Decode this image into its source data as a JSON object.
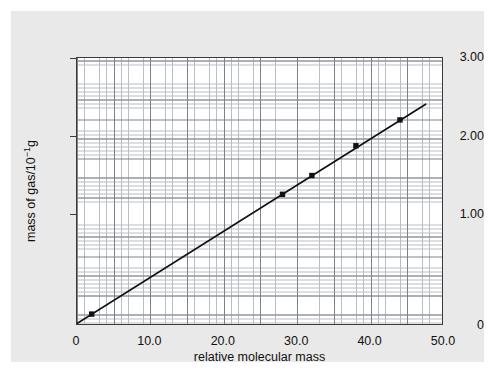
{
  "chart_data": {
    "type": "scatter",
    "title": "",
    "xlabel": "relative molecular mass",
    "ylabel": "mass of gas/10",
    "ylabel_exponent": "−1",
    "ylabel_unit": "g",
    "xlim": [
      0,
      50
    ],
    "ylim": [
      0,
      3.45
    ],
    "xticks": [
      "0",
      "10.0",
      "20.0",
      "30.0",
      "40.0",
      "50.0"
    ],
    "xtick_values": [
      0,
      10,
      20,
      30,
      40,
      50
    ],
    "yticks": [
      "0",
      "1.00",
      "2.00",
      "3.00"
    ],
    "ytick_values": [
      0,
      1.0,
      2.0,
      3.0
    ],
    "grid": true,
    "grid_style": "graph-paper",
    "legend": "none",
    "points": [
      {
        "x": 2,
        "y": 0.12
      },
      {
        "x": 28,
        "y": 1.65
      },
      {
        "x": 32,
        "y": 1.89
      },
      {
        "x": 38,
        "y": 2.27
      },
      {
        "x": 44,
        "y": 2.6
      }
    ],
    "series": [
      {
        "name": "best-fit line",
        "type": "line",
        "x_start": 0,
        "y_start": 0.0,
        "x_end": 47.5,
        "y_end": 2.8
      }
    ],
    "colors": {
      "background": "#ffffff",
      "panel": "#e9e9e9",
      "plot_background": "#ffffff",
      "axis": "#3a3a3a",
      "grid_minor": "#b9bdc4",
      "grid_major": "#7d828a",
      "line": "#111111",
      "marker": "#111111",
      "text": "#111111"
    }
  }
}
